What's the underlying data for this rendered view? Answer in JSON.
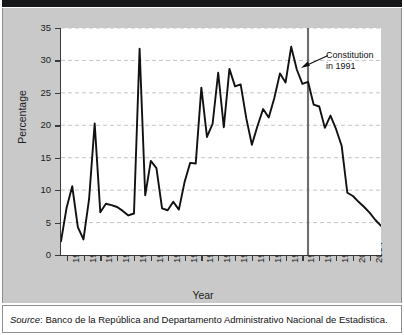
{
  "figure": {
    "source_prefix": "Source",
    "source_text": ": Banco de la República and Departamento Administrativo Nacional de Estadistica.",
    "annotation_line1": "Constitution",
    "annotation_line2": "in 1991",
    "colors": {
      "figure_background": "#c9c9c9",
      "plot_background": "#ffffff",
      "line": "#111111",
      "gridline": "#bdbdbd",
      "axis": "#3a3a3a",
      "event_line": "#6e6e6e",
      "top_bar": "#17181a"
    }
  },
  "chart_data": {
    "type": "line",
    "title": "",
    "xlabel": "Year",
    "ylabel": "Percentage",
    "xlim": [
      1949,
      2006
    ],
    "ylim": [
      0,
      35
    ],
    "yticks": [
      0,
      5,
      10,
      15,
      20,
      25,
      30,
      35
    ],
    "xticks": [
      1950,
      1953,
      1956,
      1959,
      1962,
      1965,
      1968,
      1971,
      1974,
      1977,
      1980,
      1983,
      1986,
      1989,
      1992,
      1995,
      1998,
      2001,
      2004
    ],
    "grid": "horizontal-dashed",
    "legend": "none",
    "annotations": [
      {
        "text": "Constitution in 1991",
        "arrow_points_to_year": 1993,
        "arrow_points_to_value": 26.5
      }
    ],
    "event_lines": [
      {
        "year": 1993,
        "label": "Constitution in 1991",
        "color": "#6e6e6e"
      }
    ],
    "x": [
      1949,
      1950,
      1951,
      1952,
      1953,
      1954,
      1955,
      1956,
      1957,
      1958,
      1959,
      1960,
      1961,
      1962,
      1963,
      1964,
      1965,
      1966,
      1967,
      1968,
      1969,
      1970,
      1971,
      1972,
      1973,
      1974,
      1975,
      1976,
      1977,
      1978,
      1979,
      1980,
      1981,
      1982,
      1983,
      1984,
      1985,
      1986,
      1987,
      1988,
      1989,
      1990,
      1991,
      1992,
      1993,
      1994,
      1995,
      1996,
      1997,
      1998,
      1999,
      2000,
      2001,
      2002,
      2003,
      2004,
      2005,
      2006
    ],
    "values": [
      2.1,
      7.3,
      10.6,
      4.3,
      2.4,
      8.6,
      20.3,
      6.6,
      7.9,
      7.7,
      7.4,
      6.8,
      6.1,
      6.4,
      31.8,
      9.2,
      14.5,
      13.4,
      7.2,
      6.9,
      8.2,
      7.0,
      11.2,
      14.2,
      14.1,
      25.8,
      18.2,
      20.2,
      28.1,
      19.7,
      28.7,
      26.0,
      26.3,
      21.1,
      17.0,
      19.9,
      22.5,
      21.2,
      24.2,
      28.0,
      26.6,
      32.1,
      28.6,
      26.4,
      26.7,
      23.2,
      22.9,
      19.6,
      21.5,
      19.4,
      16.8,
      9.6,
      9.1,
      8.2,
      7.4,
      6.5,
      5.4,
      4.5
    ],
    "series_name": "Percentage"
  }
}
